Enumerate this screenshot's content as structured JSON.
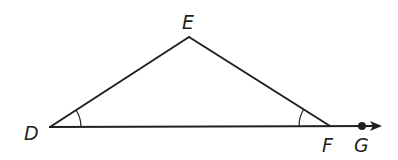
{
  "diagram": {
    "type": "geometry-triangle",
    "stroke_color": "#231f20",
    "points": {
      "D": {
        "label": "D",
        "x": 50,
        "y": 127
      },
      "E": {
        "label": "E",
        "x": 189,
        "y": 37
      },
      "F": {
        "label": "F",
        "x": 330,
        "y": 126
      },
      "G": {
        "label": "G",
        "x": 362,
        "y": 126
      }
    },
    "segments": [
      "DE",
      "EF",
      "DF"
    ],
    "rays": [
      {
        "from": "D",
        "through": "G",
        "arrow": true
      }
    ],
    "angle_marks": [
      {
        "vertex": "D",
        "between": [
          "E",
          "F"
        ],
        "arcs": 1
      },
      {
        "vertex": "F",
        "between": [
          "D",
          "E"
        ],
        "arcs": 1
      }
    ],
    "labels": {
      "E": "E",
      "D": "D",
      "F": "F",
      "G": "G"
    }
  }
}
